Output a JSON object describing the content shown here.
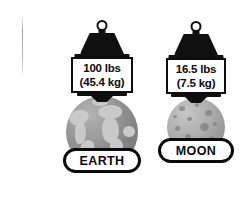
{
  "diagram": {
    "background_color": "#ffffff",
    "ink_color": "#0a0a0a"
  },
  "bodies": [
    {
      "id": "earth",
      "name_label": "EARTH",
      "weight_primary": "100 lbs",
      "weight_secondary": "(45.4 kg)",
      "sphere_kind": "earth-globe",
      "sphere_base_color": "#949494",
      "sphere_feature_color": "#c9c9c9"
    },
    {
      "id": "moon",
      "name_label": "MOON",
      "weight_primary": "16.5 lbs",
      "weight_secondary": "(7.5 kg)",
      "sphere_kind": "moon-globe",
      "sphere_base_color": "#ababab",
      "sphere_feature_color": "#838383"
    }
  ],
  "icons": {
    "weight_block": "hanging-weight-icon",
    "ring": "weight-ring-icon",
    "plate": "scale-plate-icon"
  }
}
